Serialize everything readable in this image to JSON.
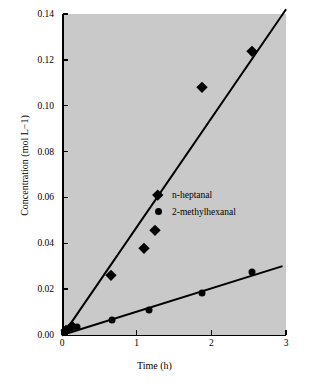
{
  "chart_data": {
    "type": "scatter",
    "title": "",
    "xlabel": "Time (h)",
    "ylabel": "Concentration (mol L−1)",
    "xlim": [
      0,
      3
    ],
    "ylim": [
      0,
      0.14
    ],
    "xticks": [
      "0",
      "1",
      "2",
      "3"
    ],
    "yticks": [
      "0.00",
      "0.02",
      "0.04",
      "0.06",
      "0.08",
      "0.10",
      "0.12",
      "0.14"
    ],
    "grid": false,
    "legend_position": "center-right-inside",
    "series": [
      {
        "name": "n-heptanal",
        "marker": "diamond",
        "points": [
          {
            "x": 0.05,
            "y": 0.002
          },
          {
            "x": 0.13,
            "y": 0.004
          },
          {
            "x": 0.65,
            "y": 0.026
          },
          {
            "x": 1.1,
            "y": 0.038
          },
          {
            "x": 1.25,
            "y": 0.046
          },
          {
            "x": 1.88,
            "y": 0.108
          },
          {
            "x": 2.55,
            "y": 0.124
          }
        ],
        "fit_line": {
          "x0": 0.0,
          "y0": 0.0,
          "x1": 3.0,
          "y1": 0.1425
        }
      },
      {
        "name": "2-methylhexanal",
        "marker": "circle",
        "points": [
          {
            "x": 0.04,
            "y": 0.0015
          },
          {
            "x": 0.12,
            "y": 0.0035
          },
          {
            "x": 0.2,
            "y": 0.0035
          },
          {
            "x": 0.67,
            "y": 0.0065
          },
          {
            "x": 1.17,
            "y": 0.011
          },
          {
            "x": 1.88,
            "y": 0.0185
          },
          {
            "x": 2.55,
            "y": 0.0275
          }
        ],
        "fit_line": {
          "x0": 0.0,
          "y0": 0.0005,
          "x1": 2.95,
          "y1": 0.0305
        }
      }
    ]
  },
  "axis": {
    "x_title": "Time (h)",
    "y_title": "Concentration (mol L−1)"
  },
  "legend": {
    "items": [
      {
        "label": "n-heptanal"
      },
      {
        "label": "2-methylhexanal"
      }
    ]
  }
}
